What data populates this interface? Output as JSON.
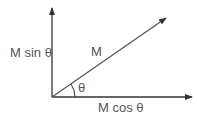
{
  "diagram": {
    "labels": {
      "vertical_component": "M sin θ",
      "horizontal_component": "M cos θ",
      "vector": "M",
      "angle": "θ"
    },
    "colors": {
      "line": "#333333",
      "text": "#555555"
    }
  }
}
